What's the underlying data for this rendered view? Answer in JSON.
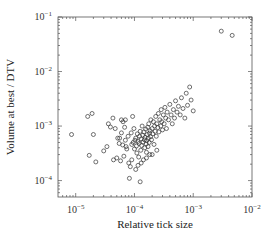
{
  "chart_data": {
    "type": "scatter",
    "title": "",
    "xlabel": "Relative tick size",
    "ylabel": "Volume at best / DTV",
    "xscale": "log",
    "yscale": "log",
    "xlim": [
      5e-06,
      0.01
    ],
    "ylim": [
      5e-05,
      0.1
    ],
    "x_ticks": [
      {
        "value": 1e-05,
        "base": "10",
        "exp": "−5"
      },
      {
        "value": 0.0001,
        "base": "10",
        "exp": "−4"
      },
      {
        "value": 0.001,
        "base": "10",
        "exp": "−3"
      },
      {
        "value": 0.01,
        "base": "10",
        "exp": "−2"
      }
    ],
    "y_ticks": [
      {
        "value": 0.0001,
        "base": "10",
        "exp": "−4"
      },
      {
        "value": 0.001,
        "base": "10",
        "exp": "−3"
      },
      {
        "value": 0.01,
        "base": "10",
        "exp": "−2"
      },
      {
        "value": 0.1,
        "base": "10",
        "exp": "−1"
      }
    ],
    "grid": false,
    "legend": null,
    "marker": "open-circle",
    "points": [
      [
        8.5e-06,
        0.0007
      ],
      [
        1.6e-05,
        0.0015
      ],
      [
        1.9e-05,
        0.0017
      ],
      [
        2e-05,
        0.0007
      ],
      [
        1.7e-05,
        0.00029
      ],
      [
        2.2e-05,
        0.00022
      ],
      [
        3e-05,
        0.00035
      ],
      [
        3.4e-05,
        0.00042
      ],
      [
        3.6e-05,
        0.0011
      ],
      [
        3.9e-05,
        0.00096
      ],
      [
        4.3e-05,
        0.0014
      ],
      [
        4.4e-05,
        0.00024
      ],
      [
        4.7e-05,
        0.0009
      ],
      [
        5e-05,
        0.00026
      ],
      [
        5.2e-05,
        0.0006
      ],
      [
        5.6e-05,
        0.0006
      ],
      [
        5.5e-05,
        0.00048
      ],
      [
        5.8e-05,
        0.00023
      ],
      [
        6e-05,
        0.0013
      ],
      [
        6.4e-05,
        0.0012
      ],
      [
        6.3e-05,
        0.00045
      ],
      [
        6.6e-05,
        0.00028
      ],
      [
        6.8e-05,
        0.00095
      ],
      [
        7e-05,
        0.0013
      ],
      [
        7.2e-05,
        0.00042
      ],
      [
        7.4e-05,
        0.00038
      ],
      [
        7.8e-05,
        0.00065
      ],
      [
        8e-05,
        0.00021
      ],
      [
        8.2e-05,
        0.00011
      ],
      [
        8.5e-05,
        0.00018
      ],
      [
        8.8e-05,
        0.00075
      ],
      [
        9e-05,
        0.00046
      ],
      [
        9.3e-05,
        0.0015
      ],
      [
        9.5e-05,
        0.0005
      ],
      [
        9.8e-05,
        0.0009
      ],
      [
        0.0001,
        0.00038
      ],
      [
        0.000102,
        0.00055
      ],
      [
        0.000105,
        0.0006
      ],
      [
        0.000108,
        0.00043
      ],
      [
        0.00011,
        0.00032
      ],
      [
        0.000112,
        0.00072
      ],
      [
        0.000115,
        0.00052
      ],
      [
        0.000118,
        0.00027
      ],
      [
        0.00012,
        0.00048
      ],
      [
        0.000122,
        0.00065
      ],
      [
        0.000125,
        0.0008
      ],
      [
        0.000128,
        0.00036
      ],
      [
        0.00013,
        0.00058
      ],
      [
        0.000132,
        0.00044
      ],
      [
        0.000135,
        0.001
      ],
      [
        0.000138,
        0.00068
      ],
      [
        0.00014,
        0.00051
      ],
      [
        0.000142,
        0.00024
      ],
      [
        0.000145,
        0.00078
      ],
      [
        0.000148,
        0.00056
      ],
      [
        0.00015,
        0.0004
      ],
      [
        0.000152,
        0.00062
      ],
      [
        0.000155,
        0.00088
      ],
      [
        0.000158,
        0.00047
      ],
      [
        0.00016,
        0.00033
      ],
      [
        0.000162,
        0.00054
      ],
      [
        0.000165,
        0.0007
      ],
      [
        0.000168,
        0.00095
      ],
      [
        0.00017,
        0.00042
      ],
      [
        0.000172,
        0.0006
      ],
      [
        0.000175,
        0.0011
      ],
      [
        0.000178,
        0.0005
      ],
      [
        0.00018,
        0.00074
      ],
      [
        0.000182,
        0.0003
      ],
      [
        0.000185,
        0.00082
      ],
      [
        0.000188,
        0.00064
      ],
      [
        0.00019,
        0.0013
      ],
      [
        0.000195,
        0.00056
      ],
      [
        0.0002,
        0.0009
      ],
      [
        0.000205,
        0.00072
      ],
      [
        0.00021,
        0.0012
      ],
      [
        0.000215,
        0.00046
      ],
      [
        0.00022,
        0.001
      ],
      [
        0.000225,
        0.0008
      ],
      [
        0.00023,
        0.0015
      ],
      [
        0.000235,
        0.00065
      ],
      [
        0.00024,
        0.0011
      ],
      [
        0.00025,
        0.00094
      ],
      [
        0.000255,
        0.0017
      ],
      [
        0.00026,
        0.00078
      ],
      [
        0.00027,
        0.0013
      ],
      [
        0.00028,
        0.001
      ],
      [
        0.000285,
        0.002
      ],
      [
        0.00029,
        0.0012
      ],
      [
        0.0003,
        0.00085
      ],
      [
        0.00031,
        0.0016
      ],
      [
        0.00032,
        0.0011
      ],
      [
        0.00033,
        0.0022
      ],
      [
        0.00034,
        0.0014
      ],
      [
        0.00035,
        0.0009
      ],
      [
        0.00036,
        0.0018
      ],
      [
        0.00038,
        0.0013
      ],
      [
        0.0004,
        0.0025
      ],
      [
        0.00042,
        0.0016
      ],
      [
        0.00044,
        0.0011
      ],
      [
        0.00046,
        0.002
      ],
      [
        0.00048,
        0.0014
      ],
      [
        0.0005,
        0.0029
      ],
      [
        0.00053,
        0.0018
      ],
      [
        0.00056,
        0.0023
      ],
      [
        0.0006,
        0.0016
      ],
      [
        0.00063,
        0.0033
      ],
      [
        0.00067,
        0.0021
      ],
      [
        0.00072,
        0.0014
      ],
      [
        0.00076,
        0.004
      ],
      [
        0.0008,
        0.0024
      ],
      [
        0.00087,
        0.0052
      ],
      [
        0.00092,
        0.003
      ],
      [
        0.001,
        0.0019
      ],
      [
        0.000105,
        0.00016
      ],
      [
        0.000115,
        0.00019
      ],
      [
        9e-05,
        0.00024
      ],
      [
        0.00013,
        0.00021
      ],
      [
        0.00016,
        0.00026
      ],
      [
        0.0002,
        0.0003
      ],
      [
        0.00024,
        0.00036
      ],
      [
        0.000125,
        9.5e-05
      ],
      [
        7e-05,
        0.00055
      ],
      [
        6e-05,
        0.00075
      ],
      [
        0.003,
        0.055
      ],
      [
        0.0046,
        0.046
      ]
    ]
  }
}
